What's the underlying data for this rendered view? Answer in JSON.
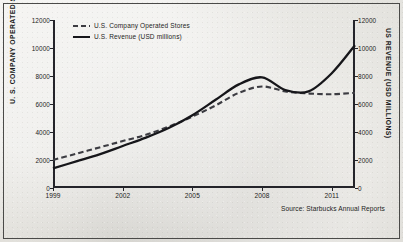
{
  "source_note": "Source: Starbucks Annual Reports",
  "legend": {
    "items": [
      {
        "label": "U.S. Company Operated Stores",
        "style": "dashed",
        "color": "#3c3c42"
      },
      {
        "label": "U.S. Revenue (USD millions)",
        "style": "solid",
        "color": "#16161a"
      }
    ]
  },
  "chart_data": {
    "type": "line",
    "title": "",
    "xlabel": "",
    "ylabel": "U. S. COMPANY OPERATED STORES",
    "y2label": "US REVENUE (USD MILLIONS)",
    "xlim": [
      1999,
      2012
    ],
    "ylim": [
      0,
      12000
    ],
    "y2lim": [
      0,
      12000
    ],
    "grid": false,
    "legend_position": "top-left inside",
    "xticks": [
      1999,
      2002,
      2005,
      2008,
      2011
    ],
    "xticklabels": [
      "1999",
      "2002",
      "2005",
      "2008",
      "2011"
    ],
    "yticks": [
      0,
      2000,
      4000,
      6000,
      8000,
      10000,
      12000
    ],
    "yticklabels": [
      "0",
      "2000",
      "4000",
      "6000",
      "8000",
      "10000",
      "12000"
    ],
    "y2ticks": [
      0,
      2000,
      4000,
      6000,
      8000,
      10000,
      12000
    ],
    "y2ticklabels": [
      "0",
      "2000",
      "4000",
      "6000",
      "8000",
      "10000",
      "12000"
    ],
    "x": [
      1999,
      2000,
      2001,
      2002,
      2003,
      2004,
      2005,
      2006,
      2007,
      2008,
      2009,
      2010,
      2011,
      2012
    ],
    "series": [
      {
        "name": "U.S. Company Operated Stores",
        "axis": "left",
        "style": "dashed",
        "color": "#3c3c42",
        "values": [
          2000,
          2450,
          2900,
          3350,
          3800,
          4400,
          5100,
          5900,
          6800,
          7250,
          6900,
          6750,
          6700,
          6800
        ]
      },
      {
        "name": "U.S. Revenue (USD millions)",
        "axis": "right",
        "style": "solid",
        "color": "#16161a",
        "values": [
          1400,
          1900,
          2400,
          3000,
          3600,
          4300,
          5200,
          6300,
          7400,
          7900,
          7000,
          6900,
          8200,
          10200
        ]
      }
    ]
  }
}
